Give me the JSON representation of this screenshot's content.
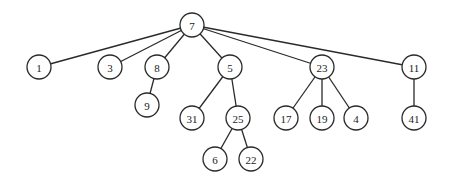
{
  "diagram": {
    "type": "tree",
    "root": "7",
    "nodes": [
      {
        "id": "n7",
        "label": "7"
      },
      {
        "id": "n1",
        "label": "1"
      },
      {
        "id": "n3",
        "label": "3"
      },
      {
        "id": "n8",
        "label": "8"
      },
      {
        "id": "n5",
        "label": "5"
      },
      {
        "id": "n23",
        "label": "23"
      },
      {
        "id": "n11",
        "label": "11"
      },
      {
        "id": "n9",
        "label": "9"
      },
      {
        "id": "n31",
        "label": "31"
      },
      {
        "id": "n25",
        "label": "25"
      },
      {
        "id": "n17",
        "label": "17"
      },
      {
        "id": "n19",
        "label": "19"
      },
      {
        "id": "n4",
        "label": "4"
      },
      {
        "id": "n41",
        "label": "41"
      },
      {
        "id": "n6",
        "label": "6"
      },
      {
        "id": "n22",
        "label": "22"
      }
    ],
    "edges": [
      {
        "from": "n7",
        "to": "n1"
      },
      {
        "from": "n7",
        "to": "n3"
      },
      {
        "from": "n7",
        "to": "n8"
      },
      {
        "from": "n7",
        "to": "n5"
      },
      {
        "from": "n7",
        "to": "n23"
      },
      {
        "from": "n7",
        "to": "n11"
      },
      {
        "from": "n8",
        "to": "n9"
      },
      {
        "from": "n5",
        "to": "n31"
      },
      {
        "from": "n5",
        "to": "n25"
      },
      {
        "from": "n23",
        "to": "n17"
      },
      {
        "from": "n23",
        "to": "n19"
      },
      {
        "from": "n23",
        "to": "n4"
      },
      {
        "from": "n11",
        "to": "n41"
      },
      {
        "from": "n25",
        "to": "n6"
      },
      {
        "from": "n25",
        "to": "n22"
      }
    ]
  }
}
